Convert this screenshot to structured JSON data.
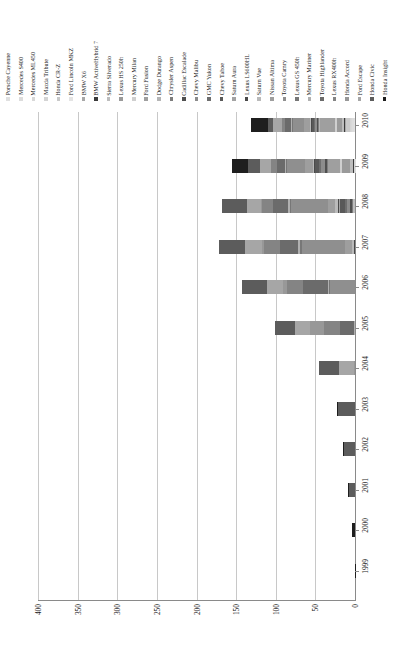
{
  "chart_data": {
    "type": "bar",
    "subtype": "stacked-horizontal",
    "title": "",
    "xlabel": "Thousand HEVs",
    "ylabel": "",
    "xlim": [
      400,
      0
    ],
    "xticks": [
      "400",
      "350",
      "300",
      "250",
      "200",
      "150",
      "100",
      "50",
      "0"
    ],
    "xtick_values": [
      400,
      350,
      300,
      250,
      200,
      150,
      100,
      50,
      0
    ],
    "grid": true,
    "axis_reversed": true,
    "orientation": "rotated-90",
    "legend_position": "top",
    "categories": [
      "2010",
      "2009",
      "2008",
      "2007",
      "2006",
      "2005",
      "2004",
      "2003",
      "2002",
      "2001",
      "2000",
      "1999"
    ],
    "series": [
      {
        "name": "Porsche Cayenne",
        "color": "#e0e0e0",
        "values": [
          1.7,
          0,
          0,
          0,
          0,
          0,
          0,
          0,
          0,
          0,
          0,
          0
        ]
      },
      {
        "name": "Mercedes S400",
        "color": "#dcdcdc",
        "values": [
          2.0,
          0.6,
          0,
          0,
          0,
          0,
          0,
          0,
          0,
          0,
          0,
          0
        ]
      },
      {
        "name": "Mercedes ML450",
        "color": "#d8d8d8",
        "values": [
          1.0,
          0,
          0,
          0,
          0,
          0,
          0,
          0,
          0,
          0,
          0,
          0
        ]
      },
      {
        "name": "Mazda Tribute",
        "color": "#d4d4d4",
        "values": [
          1.1,
          1.4,
          0,
          0,
          0,
          0,
          0,
          0,
          0,
          0,
          0,
          0
        ]
      },
      {
        "name": "Honda CR-Z",
        "color": "#c9c9c9",
        "values": [
          5.2,
          0,
          0,
          0,
          0,
          0,
          0,
          0,
          0,
          0,
          0,
          0
        ]
      },
      {
        "name": "Ford Lincoln MKZ",
        "color": "#e4e4e4",
        "values": [
          1.6,
          0,
          0,
          0,
          0,
          0,
          0,
          0,
          0,
          0,
          0,
          0
        ]
      },
      {
        "name": "BMW X6",
        "color": "#a8a8a8",
        "values": [
          0.6,
          0.4,
          0,
          0,
          0,
          0,
          0,
          0,
          0,
          0,
          0,
          0
        ]
      },
      {
        "name": "BMW ActiveHybrid 7",
        "color": "#3a3a3a",
        "values": [
          0.7,
          0.2,
          0,
          0,
          0,
          0,
          0,
          0,
          0,
          0,
          0,
          0
        ]
      },
      {
        "name": "Sierra Silverado",
        "color": "#bdbdbd",
        "values": [
          2.6,
          3.2,
          3.0,
          0,
          0,
          0,
          0,
          0,
          0,
          0,
          0,
          0
        ]
      },
      {
        "name": "Lexus HS 250h",
        "color": "#9a9a9a",
        "values": [
          6.7,
          10.7,
          0,
          0,
          0,
          0,
          0,
          0,
          0,
          0,
          0,
          0
        ]
      },
      {
        "name": "Mercury Milan",
        "color": "#cfcfcf",
        "values": [
          1.6,
          1.9,
          0,
          0,
          0,
          0,
          0,
          0,
          0,
          0,
          0,
          0
        ]
      },
      {
        "name": "Ford Fusion",
        "color": "#9f9f9f",
        "values": [
          20.8,
          15.6,
          0,
          0,
          0,
          0,
          0,
          0,
          0,
          0,
          0,
          0
        ]
      },
      {
        "name": "Dodge Durango",
        "color": "#b5b5b5",
        "values": [
          0.3,
          1.0,
          0.8,
          0,
          0,
          0,
          0,
          0,
          0,
          0,
          0,
          0
        ]
      },
      {
        "name": "Chrysler Aspen",
        "color": "#7d7d7d",
        "values": [
          0.2,
          0.7,
          0.6,
          0,
          0,
          0,
          0,
          0,
          0,
          0,
          0,
          0
        ]
      },
      {
        "name": "Cadillac Escalade",
        "color": "#4f4f4f",
        "values": [
          1.7,
          2.0,
          1.9,
          0,
          0,
          0,
          0,
          0,
          0,
          0,
          0,
          0
        ]
      },
      {
        "name": "Chevy Malibu",
        "color": "#8c8c8c",
        "values": [
          2.5,
          5.3,
          4.0,
          0,
          0,
          0,
          0,
          0,
          0,
          0,
          0,
          0
        ]
      },
      {
        "name": "GMC Yukon",
        "color": "#6e6e6e",
        "values": [
          1.7,
          2.4,
          2.3,
          0,
          0,
          0,
          0,
          0,
          0,
          0,
          0,
          0
        ]
      },
      {
        "name": "Chevy Tahoe",
        "color": "#595959",
        "values": [
          3.3,
          5.0,
          6.0,
          0,
          0,
          0,
          0,
          0,
          0,
          0,
          0,
          0
        ]
      },
      {
        "name": "Saturn Aura",
        "color": "#a3a3a3",
        "values": [
          0.2,
          0.8,
          1.6,
          0,
          0,
          0,
          0,
          0,
          0,
          0,
          0,
          0
        ]
      },
      {
        "name": "Lexus LS600HL",
        "color": "#4a4a4a",
        "values": [
          0.5,
          0.6,
          1.0,
          0.9,
          0,
          0,
          0,
          0,
          0,
          0,
          0,
          0
        ]
      },
      {
        "name": "Saturn Vue",
        "color": "#bababa",
        "values": [
          1.0,
          1.5,
          4.4,
          3.2,
          0,
          0,
          0,
          0,
          0,
          0,
          0,
          0
        ]
      },
      {
        "name": "Nissan Altima",
        "color": "#9e9e9e",
        "values": [
          7.2,
          9.4,
          8.8,
          8.4,
          0,
          0,
          0,
          0,
          0,
          0,
          0,
          0
        ]
      },
      {
        "name": "Toyota Camry",
        "color": "#8f8f8f",
        "values": [
          14.6,
          22.9,
          46.3,
          54.5,
          31.3,
          0,
          0,
          0,
          0,
          0,
          0,
          0
        ]
      },
      {
        "name": "Lexus GS 450h",
        "color": "#777777",
        "values": [
          0.7,
          1.0,
          1.6,
          2.0,
          1.8,
          0,
          0,
          0,
          0,
          0,
          0,
          0
        ]
      },
      {
        "name": "Mercury Mariner",
        "color": "#b0b0b0",
        "values": [
          1.1,
          1.1,
          2.3,
          3.2,
          1.0,
          1.0,
          0,
          0,
          0,
          0,
          0,
          0
        ]
      },
      {
        "name": "Toyota Highlander",
        "color": "#6b6b6b",
        "values": [
          7.2,
          11.0,
          19.1,
          22.0,
          31.5,
          17.9,
          0,
          0,
          0,
          0,
          0,
          0
        ]
      },
      {
        "name": "Lexus RX400h",
        "color": "#848484",
        "values": [
          4.1,
          7.0,
          15.1,
          20.0,
          20.2,
          20.7,
          0,
          0,
          0,
          0,
          0,
          0
        ]
      },
      {
        "name": "Honda Accord",
        "color": "#989898",
        "values": [
          0,
          0,
          0.1,
          3.4,
          5.6,
          16.8,
          1.1,
          0,
          0,
          0,
          0,
          0
        ]
      },
      {
        "name": "Ford Escape",
        "color": "#a6a6a6",
        "values": [
          11.0,
          14.1,
          17.2,
          21.4,
          20.1,
          18.8,
          18.8,
          0,
          0,
          0,
          0,
          0
        ]
      },
      {
        "name": "Honda Civic",
        "color": "#5c5c5c",
        "values": [
          7.3,
          15.1,
          31.3,
          32.6,
          31.3,
          25.9,
          25.6,
          21.7,
          13.7,
          7.2,
          0,
          0
        ]
      },
      {
        "name": "Honda Insight",
        "color": "#1e1e1e",
        "values": [
          20.9,
          20.6,
          0,
          0,
          0,
          0,
          0,
          0.6,
          1.0,
          1.3,
          3.8,
          0.2
        ]
      }
    ],
    "totals": [
      130.3,
      155.5,
      167.4,
      171.6,
      142.8,
      101.1,
      45.5,
      22.3,
      14.7,
      8.5,
      3.8,
      0.2
    ]
  },
  "legend": {
    "items": [
      {
        "label": "Porsche Cayenne",
        "swatch": "#e0e0e0"
      },
      {
        "label": "Mercedes S400",
        "swatch": "#dcdcdc"
      },
      {
        "label": "Mercedes ML450",
        "swatch": "#d8d8d8"
      },
      {
        "label": "Mazda Tribute",
        "swatch": "#d4d4d4"
      },
      {
        "label": "Honda CR-Z",
        "swatch": "#c9c9c9"
      },
      {
        "label": "Ford Lincoln MKZ",
        "swatch": "#e4e4e4"
      },
      {
        "label": "BMW X6",
        "swatch": "#a8a8a8"
      },
      {
        "label": "BMW ActiveHybrid 7",
        "swatch": "#3a3a3a"
      },
      {
        "label": "Sierra Silverado",
        "swatch": "#bdbdbd"
      },
      {
        "label": "Lexus HS 250h",
        "swatch": "#9a9a9a"
      },
      {
        "label": "Mercury Milan",
        "swatch": "#cfcfcf"
      },
      {
        "label": "Ford Fusion",
        "swatch": "#9f9f9f"
      },
      {
        "label": "Dodge Durango",
        "swatch": "#b5b5b5"
      },
      {
        "label": "Chrysler Aspen",
        "swatch": "#7d7d7d"
      },
      {
        "label": "Cadillac Escalade",
        "swatch": "#4f4f4f"
      },
      {
        "label": "Chevy Malibu",
        "swatch": "#8c8c8c"
      },
      {
        "label": "GMC Yukon",
        "swatch": "#6e6e6e"
      },
      {
        "label": "Chevy Tahoe",
        "swatch": "#595959"
      },
      {
        "label": "Saturn Aura",
        "swatch": "#a3a3a3"
      },
      {
        "label": "Lexus LS600HL",
        "swatch": "#4a4a4a"
      },
      {
        "label": "Saturn Vue",
        "swatch": "#bababa"
      },
      {
        "label": "Nissan Altima",
        "swatch": "#9e9e9e"
      },
      {
        "label": "Toyota Camry",
        "swatch": "#8f8f8f"
      },
      {
        "label": "Lexus GS 450h",
        "swatch": "#777777"
      },
      {
        "label": "Mercury Mariner",
        "swatch": "#b0b0b0"
      },
      {
        "label": "Toyota Highlander",
        "swatch": "#6b6b6b"
      },
      {
        "label": "Lexus RX400h",
        "swatch": "#848484"
      },
      {
        "label": "Honda Accord",
        "swatch": "#989898"
      },
      {
        "label": "Ford Escape",
        "swatch": "#a6a6a6"
      },
      {
        "label": "Honda Civic",
        "swatch": "#5c5c5c"
      },
      {
        "label": "Honda Insight",
        "swatch": "#1e1e1e"
      }
    ]
  }
}
